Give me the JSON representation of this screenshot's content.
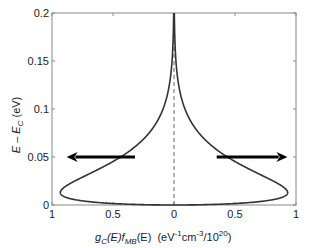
{
  "chart_data": {
    "type": "line",
    "title": "",
    "xlabel": "g_C(E) f_MB(E)  (eV^-1 cm^-3 / 10^20)",
    "ylabel": "E - E_C (eV)",
    "xlabel_parts": {
      "g": "g",
      "g_sub": "C",
      "mid1": "(E)",
      "f": "f",
      "f_sub": "MB",
      "mid2": "(E)  (eV",
      "sup1": "-1",
      "cm": "cm",
      "sup2": "-3",
      "div": "/10",
      "sup3": "20",
      "end": ")"
    },
    "ylabel_parts": {
      "main": "E – E",
      "sub": "C",
      "unit": " (eV)"
    },
    "xlim": [
      -1,
      1
    ],
    "ylim": [
      0,
      0.2
    ],
    "x_tick_values": [
      -1,
      -0.5,
      0,
      0.5,
      1
    ],
    "x_tick_labels": [
      "1",
      "0.5",
      "0",
      "0.5",
      "1"
    ],
    "y_tick_values": [
      0,
      0.05,
      0.1,
      0.15,
      0.2
    ],
    "y_tick_labels": [
      "0",
      "0.05",
      "0.1",
      "0.15",
      "0.2"
    ],
    "grid": false,
    "legend": null,
    "series": [
      {
        "name": "electron distribution (mirrored left)",
        "side": "left",
        "model": "A*sqrt(E)*exp(-E/kT)",
        "A": 13.5,
        "kT": 0.0259,
        "points": [
          [
            0,
            0
          ],
          [
            0.002,
            0.56
          ],
          [
            0.005,
            0.79
          ],
          [
            0.0125,
            0.93
          ],
          [
            0.02,
            0.88
          ],
          [
            0.03,
            0.73
          ],
          [
            0.05,
            0.44
          ],
          [
            0.075,
            0.2
          ],
          [
            0.1,
            0.09
          ],
          [
            0.15,
            0.016
          ],
          [
            0.2,
            0.002
          ]
        ]
      },
      {
        "name": "electron distribution (mirrored right)",
        "side": "right",
        "model": "A*sqrt(E)*exp(-E/kT)",
        "A": 13.5,
        "kT": 0.0259,
        "points": [
          [
            0,
            0
          ],
          [
            0.002,
            0.56
          ],
          [
            0.005,
            0.79
          ],
          [
            0.0125,
            0.93
          ],
          [
            0.02,
            0.88
          ],
          [
            0.03,
            0.73
          ],
          [
            0.05,
            0.44
          ],
          [
            0.075,
            0.2
          ],
          [
            0.1,
            0.09
          ],
          [
            0.15,
            0.016
          ],
          [
            0.2,
            0.002
          ]
        ]
      }
    ],
    "annotations": [
      {
        "type": "dashed_line",
        "x": 0,
        "y_range": [
          0,
          0.2
        ]
      },
      {
        "type": "arrow",
        "direction": "left",
        "y": 0.05,
        "x_from": -0.32,
        "x_to": -0.88
      },
      {
        "type": "arrow",
        "direction": "right",
        "y": 0.05,
        "x_from": 0.35,
        "x_to": 0.93
      }
    ],
    "colors": {
      "curve": "#333333",
      "frame": "#888888",
      "arrow": "#000000",
      "dashed": "#666666"
    }
  }
}
